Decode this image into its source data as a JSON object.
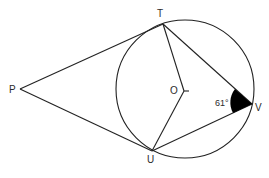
{
  "diagram": {
    "type": "circle-geometry",
    "circle": {
      "center_label": "O"
    },
    "points": {
      "P": {
        "label": "P"
      },
      "T": {
        "label": "T"
      },
      "U": {
        "label": "U"
      },
      "V": {
        "label": "V"
      },
      "O": {
        "label": "O"
      }
    },
    "segments": [
      "PT",
      "PU",
      "TO",
      "OU",
      "TV",
      "UV"
    ],
    "angles": [
      {
        "vertex": "V",
        "between": [
          "T",
          "U"
        ],
        "label": "61°",
        "shaded": true
      }
    ],
    "colors": {
      "line": "#222222",
      "text": "#2b2b2b",
      "background": "#ffffff",
      "angle_fill": "#000000"
    }
  }
}
